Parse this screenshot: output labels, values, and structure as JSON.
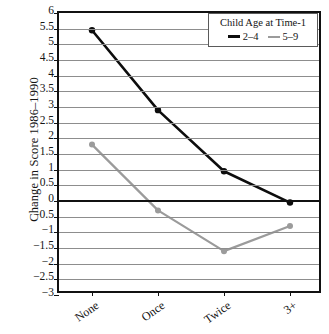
{
  "chart_data": {
    "type": "line",
    "title": "",
    "xlabel": "",
    "ylabel": "Change in Score 1986–1990",
    "categories": [
      "None",
      "Once",
      "Twice",
      "3+"
    ],
    "ylim": [
      -3,
      6
    ],
    "ytick_step": 0.5,
    "grid": true,
    "zero_line": true,
    "legend_position": "top-right",
    "legend_title": "Child Age at Time-1",
    "ytick_labels": [
      "6",
      "5.5",
      "5",
      "4.5",
      "4",
      "3.5",
      "3",
      "2.5",
      "2",
      "1.5",
      "1",
      "0.5",
      "0",
      "−0.5",
      "−1",
      "−1.5",
      "−2",
      "−2.5",
      "−3"
    ],
    "ytick_values": [
      6,
      5.5,
      5,
      4.5,
      4,
      3.5,
      3,
      2.5,
      2,
      1.5,
      1,
      0.5,
      0,
      -0.5,
      -1,
      -1.5,
      -2,
      -2.5,
      -3
    ],
    "series": [
      {
        "name": "2–4",
        "color": "#0d0d0d",
        "marker": "circle",
        "values": [
          5.45,
          2.9,
          0.95,
          -0.05
        ]
      },
      {
        "name": "5–9",
        "color": "#9b9b9b",
        "marker": "circle",
        "values": [
          1.8,
          -0.3,
          -1.6,
          -0.8
        ]
      }
    ]
  },
  "axis": {
    "y_title": "Change in Score 1986–1990"
  },
  "legend": {
    "title": "Child Age at Time-1",
    "entries": [
      {
        "label": "2–4",
        "color": "#0d0d0d"
      },
      {
        "label": "5–9",
        "color": "#9b9b9b"
      }
    ]
  }
}
